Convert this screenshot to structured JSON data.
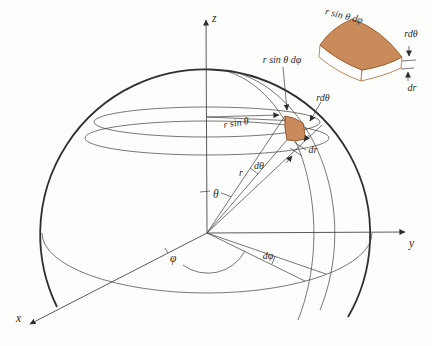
{
  "figure": {
    "colors": {
      "background": "#fdfdfb",
      "line": "#3d3d3d",
      "element_fill": "#c98a5c",
      "element_stroke": "#8f5224",
      "inset_side_fill": "#ffffff"
    },
    "axes": {
      "x": "x",
      "y": "y",
      "z": "z"
    },
    "angles": {
      "theta": "θ",
      "phi": "φ",
      "dtheta": "dθ",
      "dphi": "dφ"
    },
    "lengths": {
      "r": "r",
      "dr": "dr",
      "r_sin_theta": "r sin θ",
      "r_dtheta": "rdθ",
      "r_sin_theta_dphi": "r sin θ dφ"
    },
    "inset": {
      "top_edge": "r sin θ dφ",
      "right_edge": "rdθ",
      "thickness": "dr"
    }
  }
}
